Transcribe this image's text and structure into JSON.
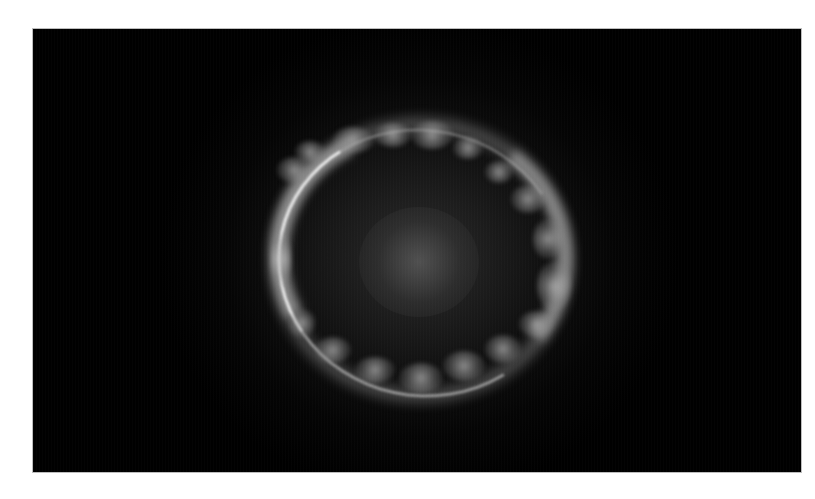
{
  "image": {
    "subject": "Einstein ring (gravitational lens) in grayscale",
    "colors": {
      "page_background": "#ffffff",
      "frame_background": "#000000",
      "ring_highlight": "#f0f0f0",
      "ring_glow": "#b4b4b4",
      "center_glow": "#6e6e6e"
    },
    "clumps": [
      {
        "x": 244,
        "y": 128,
        "w": 34,
        "h": 26
      },
      {
        "x": 262,
        "y": 112,
        "w": 30,
        "h": 22
      },
      {
        "x": 300,
        "y": 98,
        "w": 40,
        "h": 26
      },
      {
        "x": 342,
        "y": 94,
        "w": 36,
        "h": 24
      },
      {
        "x": 378,
        "y": 92,
        "w": 42,
        "h": 28
      },
      {
        "x": 420,
        "y": 108,
        "w": 30,
        "h": 22
      },
      {
        "x": 452,
        "y": 132,
        "w": 28,
        "h": 22
      },
      {
        "x": 478,
        "y": 156,
        "w": 34,
        "h": 28
      },
      {
        "x": 500,
        "y": 190,
        "w": 30,
        "h": 40
      },
      {
        "x": 504,
        "y": 232,
        "w": 34,
        "h": 50
      },
      {
        "x": 486,
        "y": 282,
        "w": 34,
        "h": 26
      },
      {
        "x": 452,
        "y": 306,
        "w": 36,
        "h": 28
      },
      {
        "x": 410,
        "y": 322,
        "w": 42,
        "h": 30
      },
      {
        "x": 366,
        "y": 334,
        "w": 44,
        "h": 30
      },
      {
        "x": 322,
        "y": 328,
        "w": 40,
        "h": 26
      },
      {
        "x": 282,
        "y": 308,
        "w": 36,
        "h": 26
      },
      {
        "x": 256,
        "y": 280,
        "w": 26,
        "h": 28
      },
      {
        "x": 238,
        "y": 200,
        "w": 20,
        "h": 60
      }
    ]
  }
}
